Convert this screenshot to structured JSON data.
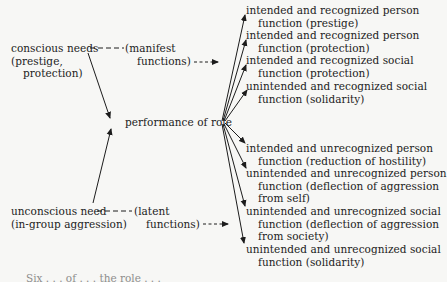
{
  "diagram": {
    "sources": {
      "conscious": {
        "line1": "conscious needs",
        "line2": "(prestige,",
        "line3": "protection)"
      },
      "unconscious": {
        "line1": "unconscious need",
        "line2": "(in-group aggression)"
      }
    },
    "function_labels": {
      "manifest_line1": "(manifest",
      "manifest_line2": "functions)",
      "latent_line1": "(latent",
      "latent_line2": "functions)"
    },
    "center": "performance of role",
    "outcomes": [
      {
        "line1": "intended and recognized person",
        "line2": "function (prestige)"
      },
      {
        "line1": "intended and recognized person",
        "line2": "function (protection)"
      },
      {
        "line1": "intended and recognized social",
        "line2": "function (protection)"
      },
      {
        "line1": "unintended and recognized social",
        "line2": "function (solidarity)"
      },
      {
        "line1": "intended and unrecognized person",
        "line2": "function (reduction of hostility)"
      },
      {
        "line1": "unintended and unrecognized person",
        "line2": "function (deflection of aggression",
        "line3": "from self)"
      },
      {
        "line1": "unintended and unrecognized social",
        "line2": "function (deflection of aggression",
        "line3": "from society)"
      },
      {
        "line1": "unintended and unrecognized social",
        "line2": "function (solidarity)"
      }
    ],
    "caption_partial": "Six . . . of . . . the role . . ."
  }
}
